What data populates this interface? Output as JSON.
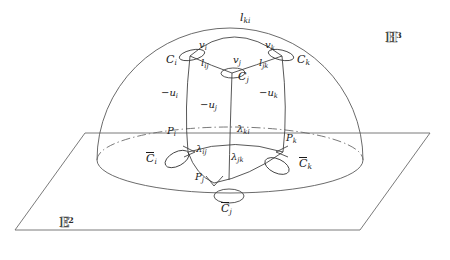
{
  "figure": {
    "ambient_space_label": "H",
    "ambient_space_exponent": "3",
    "base_plane_label": "E",
    "base_plane_exponent": "2"
  },
  "labels": {
    "C_i": "C",
    "C_i_sub": "i",
    "C_j": "C",
    "C_j_sub": "j",
    "C_k": "C",
    "C_k_sub": "k",
    "Cbar_i": "C",
    "Cbar_i_sub": "i",
    "Cbar_j": "C",
    "Cbar_j_sub": "j",
    "Cbar_k": "C",
    "Cbar_k_sub": "k",
    "v_i": "v",
    "v_i_sub": "i",
    "v_j": "v",
    "v_j_sub": "j",
    "v_k": "v",
    "v_k_sub": "k",
    "l_ij": "l",
    "l_ij_sub": "ij",
    "l_jk": "l",
    "l_jk_sub": "jk",
    "l_ki": "l",
    "l_ki_sub": "ki",
    "u_i": "−u",
    "u_i_sub": "i",
    "u_j": "−u",
    "u_j_sub": "j",
    "u_k": "−u",
    "u_k_sub": "k",
    "P_i": "P",
    "P_i_sub": "i",
    "P_j": "P",
    "P_j_sub": "j",
    "P_k": "P",
    "P_k_sub": "k",
    "lambda_ij": "λ",
    "lambda_ij_sub": "ij",
    "lambda_jk": "λ",
    "lambda_jk_sub": "jk",
    "lambda_ki": "λ",
    "lambda_ki_sub": "ki"
  },
  "colors": {
    "stroke": "#3a3a3a",
    "stroke_light": "#6b6b6b",
    "text": "#1a1a1a",
    "background": "#ffffff"
  },
  "geometry": {
    "dome_center_x": 230,
    "dome_center_y": 160,
    "dome_radius_x": 133,
    "dome_radius_y": 132,
    "equator_ry": 33,
    "plane_corners": "15,230 85,133 430,133 360,230"
  }
}
